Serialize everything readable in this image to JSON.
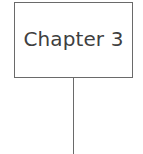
{
  "diagram": {
    "type": "tree-node-with-connector",
    "background_color": "#ffffff",
    "node": {
      "label": "Chapter 3",
      "shape": "rectangle",
      "border_color": "#6a6a6a",
      "fill_color": "#ffffff",
      "text_color": "#3f3f3f"
    },
    "connector": {
      "name": "vertical-connector",
      "orientation": "vertical",
      "color": "#6a6a6a"
    }
  }
}
